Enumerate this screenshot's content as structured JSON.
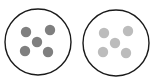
{
  "figure": {
    "title": "",
    "background_color": "#ffffff",
    "width": 152,
    "height": 84
  },
  "chart_data": {
    "type": "scatter",
    "title": "",
    "xlabel": "",
    "ylabel": "",
    "xlim": [
      0,
      152
    ],
    "ylim": [
      0,
      84
    ],
    "grid": false,
    "legend": "none",
    "annotations": [],
    "categories": [
      "left-circle",
      "right-circle"
    ],
    "series": [
      {
        "name": "left-circle",
        "dot_count": 5,
        "dot_color": "#7f7f7f",
        "dot_radius": 5.2,
        "outline_color": "#1a1a1a",
        "outline_width": 1.4,
        "fill_color": "#ffffff",
        "circle": {
          "cx": 38,
          "cy": 42,
          "r": 33
        },
        "points": [
          {
            "x": 26,
            "y": 32
          },
          {
            "x": 50,
            "y": 30
          },
          {
            "x": 37,
            "y": 42
          },
          {
            "x": 25,
            "y": 51
          },
          {
            "x": 48,
            "y": 52
          }
        ]
      },
      {
        "name": "right-circle",
        "dot_count": 5,
        "dot_color": "#bcbcbc",
        "dot_radius": 5.2,
        "outline_color": "#1a1a1a",
        "outline_width": 1.4,
        "fill_color": "#ffffff",
        "circle": {
          "cx": 116,
          "cy": 43,
          "r": 33
        },
        "points": [
          {
            "x": 104,
            "y": 33
          },
          {
            "x": 128,
            "y": 31
          },
          {
            "x": 115,
            "y": 43
          },
          {
            "x": 103,
            "y": 52
          },
          {
            "x": 126,
            "y": 53
          }
        ]
      }
    ]
  },
  "colors": {
    "background": "#ffffff",
    "outline": "#1a1a1a",
    "dot_dark": "#7f7f7f",
    "dot_light": "#bcbcbc"
  }
}
